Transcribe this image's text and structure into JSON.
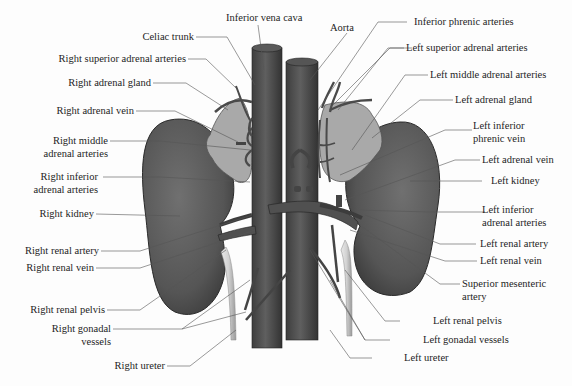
{
  "figure": {
    "colors": {
      "kidney": "#5e5e5e",
      "kidney_dark": "#3c3c3c",
      "adrenal": "#a8a8a8",
      "vessel": "#555555",
      "ureter": "#d6d6d6",
      "leader_line": "#555555",
      "background": "#fdfdfd"
    }
  },
  "labels": {
    "top": [
      {
        "id": "inferior-vena-cava",
        "text": "Inferior vena cava"
      },
      {
        "id": "aorta",
        "text": "Aorta"
      },
      {
        "id": "celiac-trunk",
        "text": "Celiac trunk"
      }
    ],
    "left": [
      {
        "id": "right-superior-adrenal-arteries",
        "text": "Right superior adrenal arteries"
      },
      {
        "id": "right-adrenal-gland",
        "text": "Right adrenal gland"
      },
      {
        "id": "right-adrenal-vein",
        "text": "Right adrenal vein"
      },
      {
        "id": "right-middle-adrenal-arteries",
        "text": "Right middle\nadrenal arteries",
        "line1": "Right middle",
        "line2": "adrenal arteries"
      },
      {
        "id": "right-inferior-adrenal-arteries",
        "text": "Right inferior\nadrenal arteries",
        "line1": "Right inferior",
        "line2": "adrenal arteries"
      },
      {
        "id": "right-kidney",
        "text": "Right kidney"
      },
      {
        "id": "right-renal-artery",
        "text": "Right renal artery"
      },
      {
        "id": "right-renal-vein",
        "text": "Right renal vein"
      },
      {
        "id": "right-renal-pelvis",
        "text": "Right renal pelvis"
      },
      {
        "id": "right-gonadal-vessels",
        "text": "Right gonadal\nvessels",
        "line1": "Right gonadal",
        "line2": "vessels"
      },
      {
        "id": "right-ureter",
        "text": "Right ureter"
      }
    ],
    "right": [
      {
        "id": "inferior-phrenic-arteries",
        "text": "Inferior phrenic arteries"
      },
      {
        "id": "left-superior-adrenal-arteries",
        "text": "Left superior adrenal arteries"
      },
      {
        "id": "left-middle-adrenal-arteries",
        "text": "Left middle adrenal arteries"
      },
      {
        "id": "left-adrenal-gland",
        "text": "Left adrenal gland"
      },
      {
        "id": "left-inferior-phrenic-vein",
        "text": "Left inferior\nphrenic vein",
        "line1": "Left inferior",
        "line2": "phrenic vein"
      },
      {
        "id": "left-adrenal-vein",
        "text": "Left adrenal vein"
      },
      {
        "id": "left-kidney",
        "text": "Left kidney"
      },
      {
        "id": "left-inferior-adrenal-arteries",
        "text": "Left inferior\nadrenal arteries",
        "line1": "Left inferior",
        "line2": "adrenal arteries"
      },
      {
        "id": "left-renal-artery",
        "text": "Left renal artery"
      },
      {
        "id": "left-renal-vein",
        "text": "Left renal vein"
      },
      {
        "id": "superior-mesenteric-artery",
        "text": "Superior mesenteric\nartery",
        "line1": "Superior mesenteric",
        "line2": "artery"
      },
      {
        "id": "left-renal-pelvis",
        "text": "Left renal pelvis"
      },
      {
        "id": "left-gonadal-vessels",
        "text": "Left gonadal vessels"
      },
      {
        "id": "left-ureter",
        "text": "Left ureter"
      }
    ]
  }
}
